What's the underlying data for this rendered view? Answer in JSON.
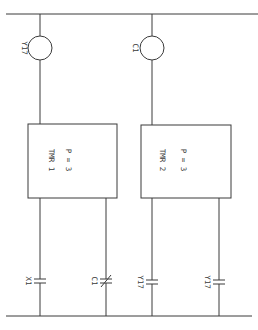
{
  "diagram": {
    "type": "ladder-logic",
    "orientation": "rotated-90",
    "coils": [
      {
        "label": "Y17"
      },
      {
        "label": "C1"
      }
    ],
    "timers": [
      {
        "name": "TMR 1",
        "preset": "P = 3"
      },
      {
        "name": "TMR 2",
        "preset": "P = 3"
      }
    ],
    "contacts": [
      {
        "label": "X1",
        "type": "normally-open"
      },
      {
        "label": "C1",
        "type": "normally-closed"
      },
      {
        "label": "Y17",
        "type": "normally-open"
      },
      {
        "label": "Y17",
        "type": "normally-open"
      }
    ]
  }
}
